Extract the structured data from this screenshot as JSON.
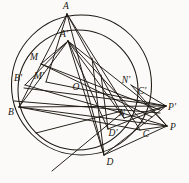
{
  "figure": {
    "type": "euclidean-diagram",
    "canvas": {
      "width": 189,
      "height": 183
    },
    "stroke_color": "#1b1812",
    "background_color": "#fbfaf8"
  },
  "circles": [
    {
      "name": "circumcircle",
      "label": "outer circle",
      "cx": 81.5,
      "cy": 85,
      "r": 70,
      "note": "main circle through A, B, C, D"
    },
    {
      "name": "inner-circle",
      "label": "inner circle",
      "cx": 78,
      "cy": 90,
      "r": 60,
      "note": "second circle through A', B', C', D'"
    }
  ],
  "points": [
    {
      "id": "A",
      "label": "A",
      "x": 67,
      "y": 14,
      "label_x": 66,
      "label_y": 7,
      "on": "outer circle"
    },
    {
      "id": "Ap",
      "label": "A'",
      "x": 68,
      "y": 41,
      "label_x": 64,
      "label_y": 35,
      "on": "inner circle"
    },
    {
      "id": "M",
      "label": "M",
      "x": 41,
      "y": 64,
      "label_x": 34,
      "label_y": 58,
      "on": "chord midpoint"
    },
    {
      "id": "Mp",
      "label": "M'",
      "x": 46,
      "y": 82,
      "label_x": 39,
      "label_y": 77,
      "on": "chord midpoint"
    },
    {
      "id": "Bp",
      "label": "B'",
      "x": 25,
      "y": 85,
      "label_x": 18,
      "label_y": 79,
      "on": "inner circle"
    },
    {
      "id": "B",
      "label": "B",
      "x": 19,
      "y": 107,
      "label_x": 11,
      "label_y": 113,
      "on": "outer circle"
    },
    {
      "id": "O",
      "label": "O",
      "x": 82,
      "y": 86,
      "label_x": 76,
      "label_y": 88,
      "on": "center"
    },
    {
      "id": "Np",
      "label": "N'",
      "x": 131,
      "y": 85,
      "label_x": 126,
      "label_y": 81,
      "on": "chord midpoint"
    },
    {
      "id": "Cp",
      "label": "C'",
      "x": 139,
      "y": 97,
      "label_x": 142,
      "label_y": 92,
      "on": "inner circle"
    },
    {
      "id": "N",
      "label": "N",
      "x": 124,
      "y": 118,
      "label_x": 122,
      "label_y": 114,
      "on": "chord midpoint"
    },
    {
      "id": "Dp",
      "label": "D'",
      "x": 108,
      "y": 129,
      "label_x": 113,
      "label_y": 134,
      "on": "inner circle"
    },
    {
      "id": "C",
      "label": "C",
      "x": 140,
      "y": 130,
      "label_x": 146,
      "label_y": 135,
      "on": "outer circle"
    },
    {
      "id": "D",
      "label": "D",
      "x": 104,
      "y": 155,
      "label_x": 110,
      "label_y": 163,
      "on": "outer circle"
    },
    {
      "id": "Pp",
      "label": "P'",
      "x": 166,
      "y": 106,
      "label_x": 172,
      "label_y": 108,
      "on": "external pole"
    },
    {
      "id": "P",
      "label": "P",
      "x": 167,
      "y": 126,
      "label_x": 173,
      "label_y": 128,
      "on": "external pole"
    }
  ],
  "segments": [
    {
      "name": "A-B",
      "x1": 67,
      "y1": 14,
      "x2": 19,
      "y2": 107
    },
    {
      "name": "A-C",
      "x1": 67,
      "y1": 14,
      "x2": 140,
      "y2": 130
    },
    {
      "name": "A-D",
      "x1": 67,
      "y1": 14,
      "x2": 104,
      "y2": 155
    },
    {
      "name": "A-Mp",
      "x1": 67,
      "y1": 14,
      "x2": 46,
      "y2": 82
    },
    {
      "name": "A-O",
      "x1": 67,
      "y1": 14,
      "x2": 124,
      "y2": 118
    },
    {
      "name": "Ap-B",
      "x1": 68,
      "y1": 41,
      "x2": 19,
      "y2": 107
    },
    {
      "name": "Ap-Bp",
      "x1": 68,
      "y1": 41,
      "x2": 25,
      "y2": 85
    },
    {
      "name": "Ap-M",
      "x1": 68,
      "y1": 41,
      "x2": 41,
      "y2": 64
    },
    {
      "name": "Ap-Cp",
      "x1": 68,
      "y1": 41,
      "x2": 139,
      "y2": 97
    },
    {
      "name": "Ap-C",
      "x1": 68,
      "y1": 41,
      "x2": 145,
      "y2": 124
    },
    {
      "name": "Ap-Dp",
      "x1": 68,
      "y1": 41,
      "x2": 108,
      "y2": 129
    },
    {
      "name": "Ap-D",
      "x1": 68,
      "y1": 41,
      "x2": 104,
      "y2": 155
    },
    {
      "name": "Ap-N",
      "x1": 68,
      "y1": 41,
      "x2": 124,
      "y2": 118
    },
    {
      "name": "M-Np",
      "x1": 41,
      "y1": 64,
      "x2": 160,
      "y2": 110
    },
    {
      "name": "Mp-Pp",
      "x1": 46,
      "y1": 82,
      "x2": 166,
      "y2": 106
    },
    {
      "name": "Bp-Cp",
      "x1": 24,
      "y1": 88,
      "x2": 166,
      "y2": 106
    },
    {
      "name": "Bp-P",
      "x1": 25,
      "y1": 85,
      "x2": 167,
      "y2": 126
    },
    {
      "name": "B-Pp",
      "x1": 19,
      "y1": 107,
      "x2": 166,
      "y2": 106
    },
    {
      "name": "B-P",
      "x1": 19,
      "y1": 107,
      "x2": 167,
      "y2": 126
    },
    {
      "name": "B-C",
      "x1": 19,
      "y1": 107,
      "x2": 140,
      "y2": 130
    },
    {
      "name": "B-Np",
      "x1": 14,
      "y1": 101,
      "x2": 160,
      "y2": 113
    },
    {
      "name": "M-Cp",
      "x1": 41,
      "y1": 64,
      "x2": 152,
      "y2": 117
    },
    {
      "name": "D-Pp",
      "x1": 104,
      "y1": 155,
      "x2": 166,
      "y2": 106
    },
    {
      "name": "D-P",
      "x1": 104,
      "y1": 155,
      "x2": 167,
      "y2": 126
    },
    {
      "name": "C-P",
      "x1": 140,
      "y1": 130,
      "x2": 167,
      "y2": 126
    },
    {
      "name": "Dp-Pp",
      "x1": 108,
      "y1": 129,
      "x2": 166,
      "y2": 106
    },
    {
      "name": "Cp-P",
      "x1": 139,
      "y1": 97,
      "x2": 167,
      "y2": 126
    },
    {
      "name": "Np-P",
      "x1": 131,
      "y1": 85,
      "x2": 167,
      "y2": 126
    },
    {
      "name": "Np-Pp",
      "x1": 131,
      "y1": 85,
      "x2": 166,
      "y2": 106
    },
    {
      "name": "N-Pp",
      "x1": 124,
      "y1": 118,
      "x2": 166,
      "y2": 106
    },
    {
      "name": "secant-lower-left",
      "x1": 52,
      "y1": 171,
      "x2": 122,
      "y2": 113
    },
    {
      "name": "secant-mid-left",
      "x1": 36,
      "y1": 133,
      "x2": 122,
      "y2": 111
    },
    {
      "name": "Dp-vertical",
      "x1": 108,
      "y1": 129,
      "x2": 101,
      "y2": 75
    },
    {
      "name": "D-vertical",
      "x1": 104,
      "y1": 155,
      "x2": 92,
      "y2": 58
    }
  ],
  "labels": [
    "A",
    "A'",
    "M",
    "M'",
    "B'",
    "B",
    "O",
    "N'",
    "C'",
    "N",
    "D'",
    "C",
    "D",
    "P'",
    "P"
  ]
}
